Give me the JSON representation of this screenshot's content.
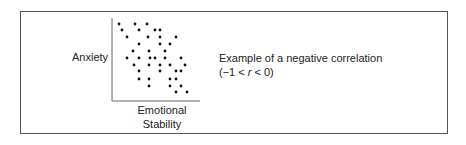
{
  "figure": {
    "y_axis_label": "Anxiety",
    "x_axis_label_line1": "Emotional",
    "x_axis_label_line2": "Stability",
    "caption_line1": "Example of a negative correlation",
    "caption_line2_prefix": "(−1 < ",
    "caption_line2_var": "r",
    "caption_line2_suffix": " < 0)"
  },
  "colors": {
    "frame": "#555555",
    "axis": "#666666",
    "dot": "#111111",
    "text": "#222222"
  },
  "chart_data": {
    "type": "scatter",
    "title": "",
    "xlabel": "Emotional Stability",
    "ylabel": "Anxiety",
    "grid": false,
    "legend": "none",
    "annotation": "Example of a negative correlation (−1 < r < 0)",
    "axis_pixels": {
      "x0": 112,
      "x1": 200,
      "y0": 101,
      "y1": 18
    },
    "points_px": [
      [
        119,
        24
      ],
      [
        135,
        24
      ],
      [
        147,
        24
      ],
      [
        122,
        30
      ],
      [
        139,
        30
      ],
      [
        155,
        30
      ],
      [
        160,
        30
      ],
      [
        127,
        37
      ],
      [
        148,
        37
      ],
      [
        160,
        37
      ],
      [
        176,
        37
      ],
      [
        139,
        44
      ],
      [
        160,
        44
      ],
      [
        170,
        44
      ],
      [
        133,
        51
      ],
      [
        149,
        51
      ],
      [
        165,
        51
      ],
      [
        127,
        58
      ],
      [
        139,
        58
      ],
      [
        150,
        58
      ],
      [
        155,
        58
      ],
      [
        165,
        58
      ],
      [
        181,
        58
      ],
      [
        134,
        65
      ],
      [
        149,
        65
      ],
      [
        160,
        65
      ],
      [
        170,
        65
      ],
      [
        185,
        65
      ],
      [
        139,
        71
      ],
      [
        160,
        71
      ],
      [
        176,
        71
      ],
      [
        181,
        71
      ],
      [
        139,
        79
      ],
      [
        149,
        79
      ],
      [
        170,
        79
      ],
      [
        176,
        79
      ],
      [
        149,
        86
      ],
      [
        170,
        86
      ],
      [
        181,
        86
      ],
      [
        176,
        92
      ],
      [
        187,
        92
      ]
    ]
  }
}
